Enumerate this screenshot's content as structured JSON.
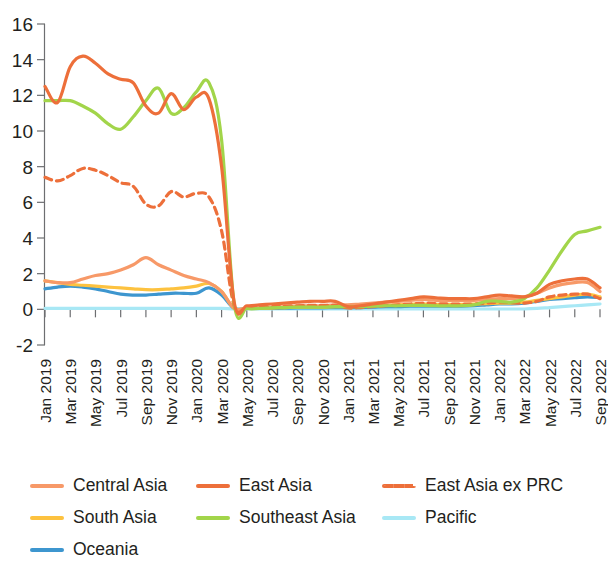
{
  "chart_data": {
    "type": "line",
    "title": "",
    "subtitle": "",
    "xlabel": "",
    "ylabel": "",
    "ylim": [
      -2,
      16
    ],
    "yticks": [
      -2,
      0,
      2,
      4,
      6,
      8,
      10,
      12,
      14,
      16
    ],
    "grid": false,
    "legend_position": "bottom",
    "x": [
      "Jan 2019",
      "Feb 2019",
      "Mar 2019",
      "Apr 2019",
      "May 2019",
      "Jun 2019",
      "Jul 2019",
      "Aug 2019",
      "Sep 2019",
      "Oct 2019",
      "Nov 2019",
      "Dec 2019",
      "Jan 2020",
      "Feb 2020",
      "Mar 2020",
      "Apr 2020",
      "May 2020",
      "Jun 2020",
      "Jul 2020",
      "Aug 2020",
      "Sep 2020",
      "Oct 2020",
      "Nov 2020",
      "Dec 2020",
      "Jan 2021",
      "Feb 2021",
      "Mar 2021",
      "Apr 2021",
      "May 2021",
      "Jun 2021",
      "Jul 2021",
      "Aug 2021",
      "Sep 2021",
      "Oct 2021",
      "Nov 2021",
      "Dec 2021",
      "Jan 2022",
      "Feb 2022",
      "Mar 2022",
      "Apr 2022",
      "May 2022",
      "Jun 2022",
      "Jul 2022",
      "Aug 2022",
      "Sep 2022"
    ],
    "xtick_labels": [
      "Jan 2019",
      "Mar 2019",
      "May 2019",
      "Jul 2019",
      "Sep 2019",
      "Nov 2019",
      "Jan 2020",
      "Mar 2020",
      "May 2020",
      "Jul 2020",
      "Sep 2020",
      "Nov 2020",
      "Jan 2021",
      "Mar 2021",
      "May 2021",
      "Jul 2021",
      "Sep 2021",
      "Nov 2021",
      "Jan 2022",
      "Mar 2022",
      "May 2022",
      "Jul 2022",
      "Sep 2022"
    ],
    "series": [
      {
        "name": "Central Asia",
        "color": "#f79968",
        "style": "solid",
        "values": [
          1.6,
          1.5,
          1.5,
          1.7,
          1.9,
          2.0,
          2.2,
          2.5,
          2.9,
          2.5,
          2.2,
          1.9,
          1.7,
          1.5,
          1.0,
          0.05,
          0.05,
          0.05,
          0.1,
          0.15,
          0.2,
          0.2,
          0.2,
          0.25,
          0.25,
          0.3,
          0.35,
          0.4,
          0.45,
          0.5,
          0.55,
          0.5,
          0.5,
          0.5,
          0.5,
          0.55,
          0.6,
          0.6,
          0.7,
          0.9,
          1.2,
          1.4,
          1.5,
          1.5,
          1.0
        ]
      },
      {
        "name": "East Asia",
        "color": "#ed6f3a",
        "style": "solid",
        "values": [
          12.5,
          11.6,
          13.6,
          14.2,
          13.8,
          13.2,
          12.9,
          12.7,
          11.4,
          11.0,
          12.1,
          11.2,
          11.9,
          11.8,
          8.0,
          0.4,
          0.2,
          0.25,
          0.3,
          0.35,
          0.4,
          0.45,
          0.45,
          0.45,
          0.15,
          0.2,
          0.3,
          0.4,
          0.5,
          0.6,
          0.7,
          0.65,
          0.6,
          0.6,
          0.6,
          0.7,
          0.8,
          0.75,
          0.7,
          0.9,
          1.4,
          1.6,
          1.7,
          1.7,
          1.2
        ]
      },
      {
        "name": "East Asia ex PRC",
        "color": "#ed6f3a",
        "style": "dashed",
        "values": [
          7.4,
          7.2,
          7.5,
          7.9,
          7.8,
          7.5,
          7.1,
          6.9,
          5.9,
          5.8,
          6.6,
          6.3,
          6.5,
          6.3,
          4.4,
          0.2,
          0.1,
          0.12,
          0.15,
          0.18,
          0.2,
          0.22,
          0.22,
          0.22,
          0.08,
          0.1,
          0.15,
          0.2,
          0.25,
          0.3,
          0.35,
          0.32,
          0.3,
          0.3,
          0.3,
          0.35,
          0.4,
          0.38,
          0.35,
          0.45,
          0.7,
          0.8,
          0.85,
          0.85,
          0.6
        ]
      },
      {
        "name": "South Asia",
        "color": "#fdc23f",
        "style": "solid",
        "values": [
          1.6,
          1.5,
          1.4,
          1.35,
          1.3,
          1.25,
          1.2,
          1.15,
          1.1,
          1.1,
          1.15,
          1.2,
          1.3,
          1.45,
          1.0,
          0.05,
          0.05,
          0.05,
          0.08,
          0.1,
          0.12,
          0.12,
          0.12,
          0.15,
          0.15,
          0.18,
          0.2,
          0.22,
          0.25,
          0.28,
          0.3,
          0.28,
          0.28,
          0.28,
          0.3,
          0.32,
          0.35,
          0.35,
          0.4,
          0.5,
          0.6,
          0.7,
          0.8,
          0.85,
          0.7
        ]
      },
      {
        "name": "Southeast Asia",
        "color": "#a2d54a",
        "style": "solid",
        "values": [
          11.7,
          11.7,
          11.7,
          11.4,
          11.0,
          10.4,
          10.1,
          10.8,
          11.7,
          12.4,
          11.0,
          11.3,
          12.2,
          12.7,
          9.5,
          0.3,
          0.05,
          0.05,
          0.08,
          0.1,
          0.12,
          0.12,
          0.12,
          0.15,
          0.15,
          0.15,
          0.18,
          0.2,
          0.2,
          0.22,
          0.22,
          0.2,
          0.2,
          0.2,
          0.25,
          0.45,
          0.45,
          0.4,
          0.6,
          1.2,
          2.2,
          3.3,
          4.2,
          4.4,
          4.6
        ]
      },
      {
        "name": "Pacific",
        "color": "#a8e8f5",
        "style": "solid",
        "values": [
          0.05,
          0.05,
          0.05,
          0.05,
          0.05,
          0.05,
          0.05,
          0.05,
          0.05,
          0.05,
          0.05,
          0.05,
          0.05,
          0.05,
          0.05,
          0.02,
          0.02,
          0.02,
          0.02,
          0.02,
          0.02,
          0.02,
          0.02,
          0.02,
          0.02,
          0.02,
          0.02,
          0.02,
          0.02,
          0.02,
          0.02,
          0.02,
          0.02,
          0.02,
          0.02,
          0.02,
          0.02,
          0.02,
          0.02,
          0.05,
          0.1,
          0.15,
          0.2,
          0.25,
          0.3
        ]
      },
      {
        "name": "Oceania",
        "color": "#3d96cf",
        "style": "solid",
        "values": [
          1.15,
          1.25,
          1.3,
          1.25,
          1.15,
          1.0,
          0.85,
          0.8,
          0.8,
          0.85,
          0.9,
          0.9,
          0.9,
          1.2,
          0.8,
          0.05,
          0.05,
          0.05,
          0.05,
          0.06,
          0.08,
          0.08,
          0.08,
          0.1,
          0.1,
          0.1,
          0.12,
          0.15,
          0.15,
          0.18,
          0.18,
          0.18,
          0.18,
          0.18,
          0.2,
          0.25,
          0.3,
          0.3,
          0.35,
          0.45,
          0.55,
          0.6,
          0.65,
          0.7,
          0.65
        ]
      }
    ]
  },
  "legend": {
    "rows": [
      [
        {
          "label": "Central Asia",
          "color": "#f79968",
          "style": "solid",
          "name": "legend-item-central-asia"
        },
        {
          "label": "East Asia",
          "color": "#ed6f3a",
          "style": "solid",
          "name": "legend-item-east-asia"
        },
        {
          "label": "East Asia ex PRC",
          "color": "#ed6f3a",
          "style": "dashed",
          "name": "legend-item-east-asia-ex-prc"
        }
      ],
      [
        {
          "label": "South Asia",
          "color": "#fdc23f",
          "style": "solid",
          "name": "legend-item-south-asia"
        },
        {
          "label": "Southeast Asia",
          "color": "#a2d54a",
          "style": "solid",
          "name": "legend-item-southeast-asia"
        },
        {
          "label": "Pacific",
          "color": "#a8e8f5",
          "style": "solid",
          "name": "legend-item-pacific"
        }
      ],
      [
        {
          "label": "Oceania",
          "color": "#3d96cf",
          "style": "solid",
          "name": "legend-item-oceania"
        }
      ]
    ]
  }
}
